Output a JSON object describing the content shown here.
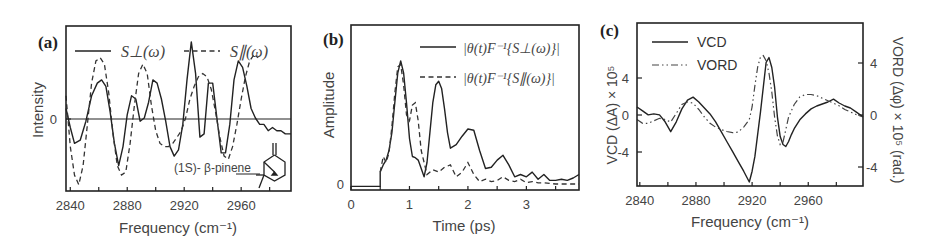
{
  "figure": {
    "panels": [
      {
        "tag": "(a)",
        "xlabel": "Frequency (cm⁻¹)",
        "ylabel": "Intensity",
        "xticks": [
          "2840",
          "2880",
          "2920",
          "2960"
        ],
        "yticks": [
          "0"
        ],
        "legend": [
          "S⊥(ω)",
          "S∥(ω)"
        ],
        "annotation": "(1S)- β-pinene"
      },
      {
        "tag": "(b)",
        "xlabel": "Time (ps)",
        "ylabel": "Amplitude",
        "xticks": [
          "0",
          "1",
          "2",
          "3"
        ],
        "yticks": [
          "0"
        ],
        "legend": [
          "|θ(t)F⁻¹{S⊥(ω)}|",
          "|θ(t)F⁻¹{S∥(ω)}|"
        ]
      },
      {
        "tag": "(c)",
        "xlabel": "Frequency (cm⁻¹)",
        "ylabel_left": "VCD (ΔA) × 10⁵",
        "ylabel_right": "VORD (Δφ) × 10⁵ (rad.)",
        "xticks": [
          "2840",
          "2880",
          "2920",
          "2960"
        ],
        "yticks_left": [
          "4",
          "0",
          "-4"
        ],
        "yticks_right": [
          "4",
          "0",
          "-4"
        ],
        "legend": [
          "VCD",
          "VORD"
        ]
      }
    ]
  },
  "chart_data": [
    {
      "type": "line",
      "title": "(a)",
      "xlabel": "Frequency (cm^-1)",
      "ylabel": "Intensity",
      "xlim": [
        2837,
        2995
      ],
      "ylim": [
        -1.25,
        1.35
      ],
      "x_ticks": [
        2840,
        2880,
        2920,
        2960
      ],
      "y_ticks": [
        0
      ],
      "zero_line": true,
      "legend_position": "top",
      "annotation": "(1S)- β-pinene (molecular structure inset, lower right)",
      "series": [
        {
          "name": "S⊥(ω)",
          "style": "solid",
          "x": [
            2837,
            2840,
            2843,
            2847,
            2851,
            2855,
            2859,
            2862,
            2865,
            2868,
            2871,
            2874,
            2877,
            2880,
            2883,
            2886,
            2889,
            2892,
            2895,
            2898,
            2901,
            2904,
            2907,
            2910,
            2913,
            2916,
            2919,
            2922,
            2925,
            2928,
            2931,
            2934,
            2937,
            2940,
            2943,
            2946,
            2949,
            2952,
            2955,
            2958,
            2961,
            2964,
            2967,
            2970,
            2973,
            2976,
            2979,
            2982,
            2985,
            2988,
            2991,
            2995
          ],
          "y": [
            0.05,
            -0.25,
            -0.5,
            -0.45,
            -0.15,
            0.25,
            0.45,
            0.5,
            0.4,
            0.0,
            -0.5,
            -0.85,
            -0.55,
            -0.05,
            0.25,
            0.2,
            -0.15,
            -0.1,
            0.15,
            0.5,
            0.45,
            0.2,
            -0.15,
            -0.55,
            -0.7,
            -0.6,
            -0.2,
            0.5,
            1.1,
            0.6,
            -0.4,
            -0.35,
            0.45,
            0.45,
            -0.1,
            -0.65,
            -0.65,
            -0.2,
            0.5,
            0.8,
            0.7,
            0.4,
            0.05,
            -0.1,
            -0.2,
            -0.2,
            -0.3,
            -0.25,
            -0.3,
            -0.3,
            -0.35,
            -0.35
          ]
        },
        {
          "name": "S∥(ω)",
          "style": "dashed",
          "x": [
            2837,
            2840,
            2843,
            2846,
            2849,
            2852,
            2855,
            2858,
            2861,
            2864,
            2867,
            2870,
            2873,
            2876,
            2879,
            2882,
            2885,
            2888,
            2891,
            2894,
            2897,
            2900,
            2903,
            2906,
            2909,
            2912,
            2915,
            2918,
            2921,
            2924,
            2927,
            2930,
            2933,
            2936,
            2939,
            2942,
            2945,
            2948,
            2951,
            2954,
            2957,
            2960,
            2963,
            2966,
            2969,
            2972,
            2975,
            2978,
            2981,
            2984,
            2987,
            2991,
            2995
          ],
          "y": [
            0.25,
            -0.55,
            -1.0,
            -1.15,
            -0.85,
            -0.2,
            0.45,
            0.8,
            0.85,
            0.75,
            0.3,
            -0.35,
            -0.85,
            -1.0,
            -0.95,
            -0.5,
            0.1,
            0.6,
            0.75,
            0.6,
            0.1,
            -0.3,
            -0.5,
            -0.55,
            -0.55,
            -0.5,
            -0.4,
            -0.3,
            -0.1,
            0.2,
            0.4,
            0.55,
            0.6,
            0.55,
            0.35,
            0.0,
            -0.4,
            -0.7,
            -0.75,
            -0.55,
            -0.2,
            0.2,
            0.55,
            0.8,
            0.9,
            0.85
          ]
        }
      ]
    },
    {
      "type": "line",
      "title": "(b)",
      "xlabel": "Time (ps)",
      "ylabel": "Amplitude",
      "xlim": [
        0,
        3.9
      ],
      "ylim": [
        -0.03,
        1.35
      ],
      "x_ticks": [
        0,
        1,
        2,
        3
      ],
      "y_ticks": [
        0
      ],
      "legend_position": "upper right",
      "series": [
        {
          "name": "|θ(t)F⁻¹{S⊥(ω)}|",
          "style": "solid",
          "x": [
            0,
            0.5,
            0.5,
            0.55,
            0.6,
            0.65,
            0.7,
            0.75,
            0.8,
            0.85,
            0.9,
            0.95,
            1.0,
            1.05,
            1.1,
            1.15,
            1.2,
            1.25,
            1.3,
            1.35,
            1.4,
            1.45,
            1.5,
            1.55,
            1.6,
            1.65,
            1.7,
            1.8,
            1.9,
            2.0,
            2.1,
            2.2,
            2.3,
            2.4,
            2.5,
            2.6,
            2.7,
            2.8,
            2.9,
            3.0,
            3.1,
            3.2,
            3.3,
            3.4,
            3.5,
            3.6,
            3.7,
            3.8,
            3.9
          ],
          "y": [
            0,
            0,
            0.12,
            0.18,
            0.22,
            0.3,
            0.45,
            0.7,
            0.95,
            1.05,
            0.95,
            0.7,
            0.4,
            0.25,
            0.24,
            0.22,
            0.15,
            0.08,
            0.2,
            0.45,
            0.7,
            0.85,
            0.88,
            0.82,
            0.65,
            0.45,
            0.32,
            0.35,
            0.42,
            0.48,
            0.47,
            0.3,
            0.15,
            0.16,
            0.22,
            0.26,
            0.18,
            0.08,
            0.1,
            0.08,
            0.12,
            0.06,
            0.1,
            0.05,
            0.05,
            0.06,
            0.05,
            0.07,
            0.1
          ]
        },
        {
          "name": "|θ(t)F⁻¹{S∥(ω)}|",
          "style": "dashed",
          "x": [
            0.5,
            0.55,
            0.6,
            0.65,
            0.7,
            0.75,
            0.8,
            0.85,
            0.9,
            0.95,
            1.0,
            1.05,
            1.1,
            1.15,
            1.2,
            1.3,
            1.4,
            1.5,
            1.6,
            1.7,
            1.8,
            1.9,
            2.0,
            2.1,
            2.2,
            2.3,
            2.4,
            2.5,
            2.6,
            2.7,
            2.8,
            2.9,
            3.0,
            3.1,
            3.2,
            3.3,
            3.5,
            3.7,
            3.9
          ],
          "y": [
            0.12,
            0.25,
            0.2,
            0.28,
            0.5,
            0.78,
            1.0,
            1.02,
            0.85,
            0.6,
            0.55,
            0.68,
            0.7,
            0.55,
            0.3,
            0.1,
            0.14,
            0.12,
            0.16,
            0.18,
            0.08,
            0.12,
            0.2,
            0.1,
            0.04,
            0.06,
            0.04,
            0.05,
            0.08,
            0.05,
            0.04,
            0.06,
            0.03,
            0.04,
            0.03,
            0.03,
            0.02,
            0.02,
            0.02
          ]
        }
      ]
    },
    {
      "type": "line",
      "title": "(c)",
      "xlabel": "Frequency (cm^-1)",
      "ylabel": "VCD (ΔA) × 10^5",
      "ylabel_right": "VORD (Δφ) × 10^5 (rad.)",
      "xlim": [
        2838,
        2999
      ],
      "ylim_left": [
        -7,
        9.5
      ],
      "ylim_right": [
        -5.5,
        7.5
      ],
      "x_ticks": [
        2840,
        2880,
        2920,
        2960
      ],
      "y_ticks_left": [
        -4,
        0,
        4
      ],
      "y_ticks_right": [
        -4,
        0,
        4
      ],
      "legend_position": "upper left",
      "series": [
        {
          "name": "VCD",
          "style": "solid",
          "axis": "left",
          "x": [
            2838,
            2842,
            2846,
            2850,
            2854,
            2858,
            2862,
            2866,
            2870,
            2874,
            2878,
            2882,
            2886,
            2890,
            2894,
            2898,
            2902,
            2906,
            2910,
            2914,
            2918,
            2920,
            2922,
            2926,
            2930,
            2932,
            2934,
            2936,
            2938,
            2940,
            2942,
            2944,
            2946,
            2948,
            2950,
            2954,
            2958,
            2962,
            2966,
            2970,
            2974,
            2978,
            2982,
            2986,
            2990,
            2994,
            2999
          ],
          "y": [
            1.0,
            0.6,
            0.2,
            0.3,
            0.2,
            -0.5,
            -1.5,
            -0.5,
            0.8,
            1.7,
            2.0,
            1.5,
            0.9,
            0.3,
            -0.5,
            -1.5,
            -2.5,
            -3.5,
            -4.5,
            -5.5,
            -6.6,
            -5.5,
            -4.0,
            0.5,
            5.5,
            6.0,
            5.0,
            3.0,
            0.0,
            -2.0,
            -2.8,
            -3.0,
            -2.5,
            -1.8,
            -1.2,
            -0.3,
            0.3,
            0.8,
            1.1,
            1.3,
            1.5,
            1.8,
            1.4,
            1.1,
            0.9,
            0.5,
            0.0
          ]
        },
        {
          "name": "VORD",
          "style": "dash-dot",
          "axis": "right",
          "x": [
            2838,
            2842,
            2846,
            2850,
            2854,
            2858,
            2862,
            2866,
            2870,
            2874,
            2878,
            2882,
            2886,
            2890,
            2894,
            2898,
            2902,
            2906,
            2910,
            2914,
            2918,
            2920,
            2922,
            2924,
            2926,
            2928,
            2930,
            2932,
            2934,
            2936,
            2938,
            2940,
            2942,
            2944,
            2946,
            2950,
            2954,
            2958,
            2962,
            2966,
            2970,
            2974,
            2978,
            2982,
            2986,
            2990,
            2994,
            2999
          ],
          "y": [
            -0.2,
            -0.5,
            -0.5,
            -0.3,
            -0.1,
            -0.2,
            -0.4,
            0.3,
            1.0,
            1.2,
            1.1,
            0.6,
            0.0,
            -0.5,
            -0.8,
            -1.0,
            -1.15,
            -1.25,
            -1.2,
            -0.8,
            -0.2,
            0.8,
            2.5,
            4.0,
            4.8,
            4.9,
            4.5,
            3.5,
            2.0,
            0.0,
            -1.5,
            -2.2,
            -2.0,
            -1.0,
            0.0,
            1.0,
            1.6,
            1.8,
            1.8,
            1.7,
            1.5,
            1.3,
            1.1,
            0.9,
            0.6,
            0.4,
            0.2,
            0.0
          ]
        }
      ]
    }
  ]
}
